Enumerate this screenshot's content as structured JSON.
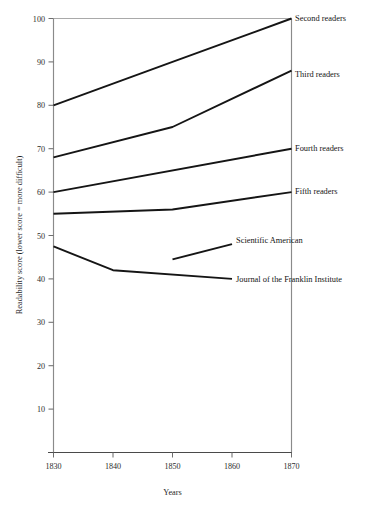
{
  "chart_data": {
    "type": "line",
    "title": "",
    "xlabel": "Years",
    "ylabel": "Readability score (lower score = more difficult)",
    "xlim": [
      1828,
      1871
    ],
    "ylim": [
      0,
      100
    ],
    "xticks": [
      1830,
      1840,
      1850,
      1860,
      1870
    ],
    "xtick_labels": [
      "1830",
      "1840",
      "1850",
      "1860",
      "1870"
    ],
    "yticks": [
      10,
      20,
      30,
      40,
      50,
      60,
      70,
      80,
      90,
      100
    ],
    "ytick_labels": [
      "10",
      "20",
      "30",
      "40",
      "50",
      "60",
      "70",
      "80",
      "90",
      "100"
    ],
    "grid": false,
    "legend_position": "right-inline-labels",
    "series": [
      {
        "name": "Second readers",
        "label": "Second readers",
        "x": [
          1830,
          1850,
          1870
        ],
        "values": [
          80,
          90,
          100
        ]
      },
      {
        "name": "Third readers",
        "label": "Third readers",
        "x": [
          1830,
          1850,
          1870
        ],
        "values": [
          68,
          75,
          88
        ]
      },
      {
        "name": "Fourth readers",
        "label": "Fourth readers",
        "x": [
          1830,
          1870
        ],
        "values": [
          60,
          70
        ]
      },
      {
        "name": "Fifth readers",
        "label": "Fifth readers",
        "x": [
          1830,
          1850,
          1870
        ],
        "values": [
          55,
          56,
          60
        ]
      },
      {
        "name": "Scientific American",
        "label": "Scientific American",
        "x": [
          1850,
          1860
        ],
        "values": [
          44.5,
          48
        ]
      },
      {
        "name": "Journal of the Franklin Institute",
        "label": "Journal of the Franklin Institute",
        "x": [
          1830,
          1840,
          1860
        ],
        "values": [
          47.5,
          42,
          40
        ]
      }
    ]
  },
  "annotations": {
    "second_readers": "Second readers",
    "third_readers": "Third readers",
    "fourth_readers": "Fourth readers",
    "fifth_readers": "Fifth readers",
    "scientific_american": "Scientific American",
    "journal_franklin": "Journal of the Franklin Institute"
  },
  "axis": {
    "x_title": "Years",
    "y_title": "Readability score (lower score = more difficult)"
  },
  "ytick_text": {
    "t100": "100",
    "t90": "90",
    "t80": "80",
    "t70": "70",
    "t60": "60",
    "t50": "50",
    "t40": "40",
    "t30": "30",
    "t20": "20",
    "t10": "10"
  },
  "xtick_text": {
    "t1830": "1830",
    "t1840": "1840",
    "t1850": "1850",
    "t1860": "1860",
    "t1870": "1870"
  }
}
